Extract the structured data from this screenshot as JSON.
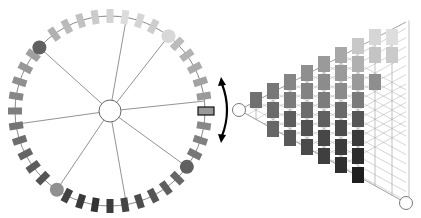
{
  "diagram": {
    "ring": {
      "cx": 110,
      "cy": 111,
      "r": 95,
      "center_node_r": 11,
      "segment_count": 40,
      "spoke_angles_deg": [
        -80,
        -52,
        -6,
        36,
        80,
        124,
        172,
        222
      ],
      "spoke_node_angles_deg": [
        -52,
        36,
        124,
        222
      ],
      "spoke_node_colors": [
        "#d8d8d8",
        "#606060",
        "#909090",
        "#606060"
      ],
      "highlight_angle_deg": 0,
      "highlight_color": "#999999"
    },
    "arrow": {
      "x": 224,
      "y_top": 78,
      "y_bottom": 142,
      "color": "#000000"
    },
    "lattice": {
      "apex": {
        "x": 239,
        "y": 110
      },
      "bottom_node": {
        "x": 406,
        "y": 203
      },
      "columns": [
        {
          "x": 256,
          "boxes": [
            {
              "y": 100,
              "c": "#707070"
            }
          ]
        },
        {
          "x": 273,
          "boxes": [
            {
              "y": 91,
              "c": "#777777"
            },
            {
              "y": 110,
              "c": "#6a6a6a"
            },
            {
              "y": 129,
              "c": "#666666"
            }
          ]
        },
        {
          "x": 290,
          "boxes": [
            {
              "y": 82,
              "c": "#858585"
            },
            {
              "y": 100,
              "c": "#7a7a7a"
            },
            {
              "y": 119,
              "c": "#5c5c5c"
            },
            {
              "y": 138,
              "c": "#585858"
            }
          ]
        },
        {
          "x": 307,
          "boxes": [
            {
              "y": 73,
              "c": "#8f8f8f"
            },
            {
              "y": 91,
              "c": "#828282"
            },
            {
              "y": 110,
              "c": "#6c6c6c"
            },
            {
              "y": 128,
              "c": "#505050"
            },
            {
              "y": 147,
              "c": "#4a4a4a"
            }
          ]
        },
        {
          "x": 324,
          "boxes": [
            {
              "y": 64,
              "c": "#9a9a9a"
            },
            {
              "y": 82,
              "c": "#8c8c8c"
            },
            {
              "y": 100,
              "c": "#7c7c7c"
            },
            {
              "y": 119,
              "c": "#606060"
            },
            {
              "y": 138,
              "c": "#474747"
            },
            {
              "y": 156,
              "c": "#3f3f3f"
            }
          ]
        },
        {
          "x": 341,
          "boxes": [
            {
              "y": 55,
              "c": "#a8a8a8"
            },
            {
              "y": 73,
              "c": "#9a9a9a"
            },
            {
              "y": 91,
              "c": "#8a8a8a"
            },
            {
              "y": 110,
              "c": "#6a6a6a"
            },
            {
              "y": 128,
              "c": "#4c4c4c"
            },
            {
              "y": 147,
              "c": "#3c3c3c"
            },
            {
              "y": 165,
              "c": "#303030"
            }
          ]
        },
        {
          "x": 358,
          "boxes": [
            {
              "y": 46,
              "c": "#c8c8c8"
            },
            {
              "y": 64,
              "c": "#b0b0b0"
            },
            {
              "y": 82,
              "c": "#9a9a9a"
            },
            {
              "y": 100,
              "c": "#7a7a7a"
            },
            {
              "y": 119,
              "c": "#555555"
            },
            {
              "y": 138,
              "c": "#3a3a3a"
            },
            {
              "y": 156,
              "c": "#2c2c2c"
            },
            {
              "y": 175,
              "c": "#1e1e1e"
            }
          ]
        },
        {
          "x": 375,
          "boxes": [
            {
              "y": 37,
              "c": "#d6d6d6"
            },
            {
              "y": 55,
              "c": "#c4c4c4"
            },
            {
              "y": 82,
              "c": "#8e8e8e"
            }
          ]
        },
        {
          "x": 392,
          "boxes": [
            {
              "y": 37,
              "c": "#dedede"
            },
            {
              "y": 55,
              "c": "#cacaca"
            }
          ]
        }
      ]
    }
  }
}
